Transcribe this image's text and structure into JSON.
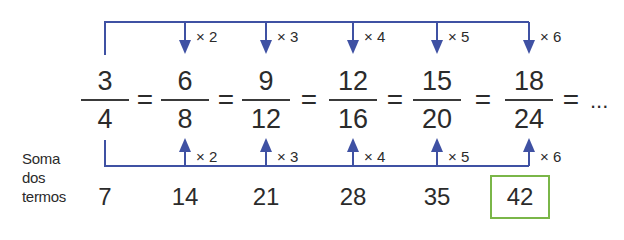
{
  "colors": {
    "arrow": "#3f51a3",
    "highlight_box": "#7ab648",
    "text": "#2b2b2b"
  },
  "fractions": [
    {
      "numerator": "3",
      "denominator": "4"
    },
    {
      "numerator": "6",
      "denominator": "8"
    },
    {
      "numerator": "9",
      "denominator": "12"
    },
    {
      "numerator": "12",
      "denominator": "16"
    },
    {
      "numerator": "15",
      "denominator": "20"
    },
    {
      "numerator": "18",
      "denominator": "24"
    }
  ],
  "equals_sign": "=",
  "continuation": "...",
  "top_multipliers": [
    "× 2",
    "× 3",
    "× 4",
    "× 5",
    "× 6"
  ],
  "bottom_multipliers": [
    "× 2",
    "× 3",
    "× 4",
    "× 5",
    "× 6"
  ],
  "sum_label": {
    "line1": "Soma",
    "line2": "dos",
    "line3": "termos"
  },
  "sums": [
    "7",
    "14",
    "21",
    "28",
    "35",
    "42"
  ],
  "highlighted_sum": "42"
}
